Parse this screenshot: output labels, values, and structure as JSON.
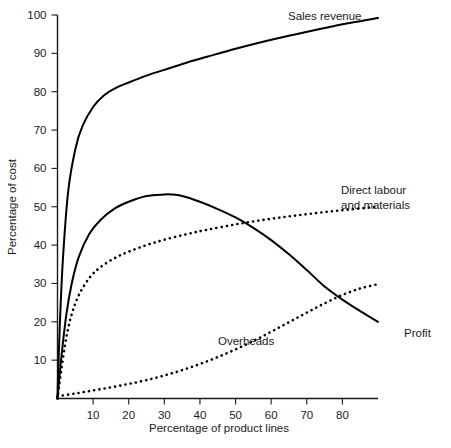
{
  "chart_data": {
    "type": "line",
    "title": "",
    "xlabel": "Percentage of product lines",
    "ylabel": "Percentage of cost",
    "xlim": [
      0,
      90
    ],
    "ylim": [
      0,
      100
    ],
    "grid": false,
    "legend_position": "inline-annotations",
    "xticks": [
      10,
      20,
      30,
      40,
      50,
      60,
      70,
      80
    ],
    "yticks": [
      10,
      20,
      30,
      40,
      50,
      60,
      70,
      80,
      90,
      100
    ],
    "xtick_labels": [
      "10",
      "20",
      "30",
      "40",
      "50",
      "60",
      "70",
      "80"
    ],
    "ytick_labels": [
      "10",
      "20",
      "30",
      "40",
      "50",
      "60",
      "70",
      "80",
      "90",
      "100"
    ],
    "series": [
      {
        "name": "Sales revenue",
        "style": "solid",
        "color": "#000000",
        "label_text": "Sales revenue",
        "x": [
          0,
          0.6,
          1.5,
          3,
          5,
          7,
          10,
          13,
          16,
          20,
          25,
          30,
          36,
          42,
          50,
          58,
          66,
          74,
          82,
          90
        ],
        "y": [
          0,
          18,
          36,
          54,
          65,
          71,
          76,
          79,
          80.8,
          82.4,
          84.2,
          85.7,
          87.5,
          89.1,
          91.2,
          93.1,
          94.8,
          96.4,
          97.9,
          99.2
        ]
      },
      {
        "name": "Profit",
        "style": "solid",
        "color": "#000000",
        "label_text": "Profit",
        "x": [
          0,
          1,
          2.5,
          4,
          6,
          9,
          12,
          16,
          20,
          25,
          30,
          32,
          35,
          40,
          45,
          50,
          55,
          60,
          65,
          70,
          75,
          80,
          85,
          90
        ],
        "y": [
          0,
          10,
          22,
          30,
          37,
          43,
          46.5,
          49.5,
          51.3,
          52.8,
          53.2,
          53.2,
          52.8,
          51.3,
          49.4,
          47.2,
          44.5,
          41.3,
          37.6,
          33.5,
          29.2,
          25.8,
          22.8,
          20.0
        ]
      },
      {
        "name": "Direct labour and materials",
        "style": "dotted",
        "color": "#000000",
        "label_text": "Direct labour\nand materials",
        "label_lines": [
          "Direct labour",
          "and materials"
        ],
        "x": [
          0,
          1,
          2.5,
          4,
          6,
          9,
          12,
          16,
          20,
          25,
          30,
          36,
          42,
          50,
          58,
          66,
          74,
          82,
          90
        ],
        "y": [
          0,
          7,
          16,
          22,
          27,
          31.5,
          34.2,
          36.6,
          38.3,
          40.0,
          41.4,
          42.8,
          44.0,
          45.4,
          46.6,
          47.6,
          48.5,
          49.3,
          50.0
        ]
      },
      {
        "name": "Overheads",
        "style": "dotted",
        "color": "#000000",
        "label_text": "Overheads",
        "x": [
          0,
          5,
          10,
          15,
          20,
          25,
          30,
          35,
          40,
          45,
          50,
          55,
          60,
          65,
          70,
          75,
          80,
          85,
          90
        ],
        "y": [
          0.6,
          1.3,
          2.1,
          2.9,
          3.8,
          4.8,
          6.0,
          7.4,
          9.0,
          10.8,
          12.8,
          15.0,
          17.4,
          19.9,
          22.4,
          24.8,
          27.0,
          28.7,
          29.8
        ]
      }
    ],
    "annotations": [
      {
        "text": "Sales revenue",
        "x_value": 58,
        "y_value": 99
      },
      {
        "text": "Direct labour",
        "x_value": 74,
        "y_value": 58
      },
      {
        "text": "and materials",
        "x_value": 74,
        "y_value": 53
      },
      {
        "text": "Overheads",
        "x_value": 40,
        "y_value": 13
      },
      {
        "text": "Profit",
        "x_value": 85,
        "y_value": 16
      }
    ]
  },
  "axes": {
    "y_title": "Percentage of cost",
    "x_title": "Percentage of product lines"
  },
  "colors": {
    "background": "#ffffff",
    "ink": "#1a1a1a",
    "curve": "#000000"
  }
}
